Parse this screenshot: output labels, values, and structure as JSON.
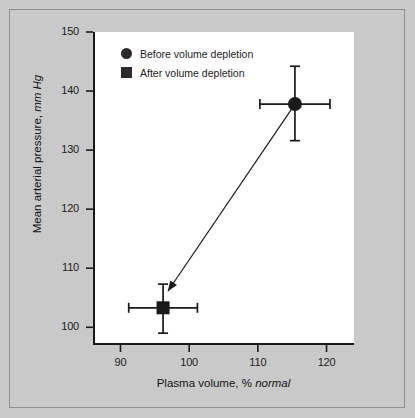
{
  "chart_data": {
    "type": "scatter",
    "title": "",
    "xlabel_plain": "Plasma volume, % ",
    "xlabel_italic": "normal",
    "ylabel_plain": "Mean arterial pressure, ",
    "ylabel_italic": "mm Hg",
    "xlim": [
      86,
      124
    ],
    "ylim": [
      97,
      150
    ],
    "xticks": [
      "90",
      "100",
      "110",
      "120"
    ],
    "xtick_values": [
      90,
      100,
      110,
      120
    ],
    "yticks": [
      "150",
      "140",
      "130",
      "120",
      "110",
      "100"
    ],
    "ytick_values": [
      150,
      140,
      130,
      120,
      110,
      100
    ],
    "grid": false,
    "legend_position": "upper-left-inside",
    "series": [
      {
        "name": "Before volume depletion",
        "marker": "circle",
        "color": "#1a1a1a",
        "x": 115.4,
        "y": 137.8,
        "x_err_low": 110.3,
        "x_err_high": 120.5,
        "y_err_low": 131.6,
        "y_err_high": 144.2
      },
      {
        "name": "After volume depletion",
        "marker": "square",
        "color": "#1a1a1a",
        "x": 96.2,
        "y": 103.3,
        "x_err_low": 91.2,
        "x_err_high": 101.2,
        "y_err_low": 99.0,
        "y_err_high": 107.3
      }
    ],
    "annotations": [
      {
        "type": "arrow",
        "from_x": 115.4,
        "from_y": 137.8,
        "to_x": 96.9,
        "to_y": 106.1,
        "description": "arrow from before to after point"
      }
    ]
  },
  "legend": {
    "items": [
      {
        "label": "Before volume depletion",
        "marker": "circle"
      },
      {
        "label": "After volume depletion",
        "marker": "square"
      }
    ]
  }
}
